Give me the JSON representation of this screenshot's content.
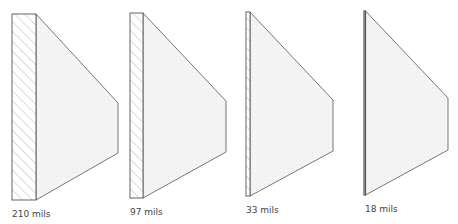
{
  "diagram": {
    "colors": {
      "stroke": "#555555",
      "hatch": "#b5b5b5",
      "fill": "#f3f3f3",
      "label": "#444444"
    },
    "figures": [
      {
        "label": "210 mils",
        "thickness_mils": 210,
        "plate": {
          "x": 12,
          "y": 14,
          "w": 24,
          "h": 186
        },
        "trapezoid": {
          "right_x": 118,
          "right_top": 103,
          "right_bottom": 153
        },
        "label_pos": {
          "x": 12,
          "y": 209
        }
      },
      {
        "label": "97 mils",
        "thickness_mils": 97,
        "plate": {
          "x": 130,
          "y": 13,
          "w": 13,
          "h": 185
        },
        "trapezoid": {
          "right_x": 226,
          "right_top": 101,
          "right_bottom": 152
        },
        "label_pos": {
          "x": 130,
          "y": 207
        }
      },
      {
        "label": "33 mils",
        "thickness_mils": 33,
        "plate": {
          "x": 246,
          "y": 12,
          "w": 4,
          "h": 184
        },
        "trapezoid": {
          "right_x": 333,
          "right_top": 100,
          "right_bottom": 151
        },
        "label_pos": {
          "x": 246,
          "y": 205
        }
      },
      {
        "label": "18 mils",
        "thickness_mils": 18,
        "plate": {
          "x": 364,
          "y": 11,
          "w": 1.5,
          "h": 184
        },
        "trapezoid": {
          "right_x": 448,
          "right_top": 98,
          "right_bottom": 150
        },
        "label_pos": {
          "x": 365,
          "y": 204
        }
      }
    ]
  }
}
